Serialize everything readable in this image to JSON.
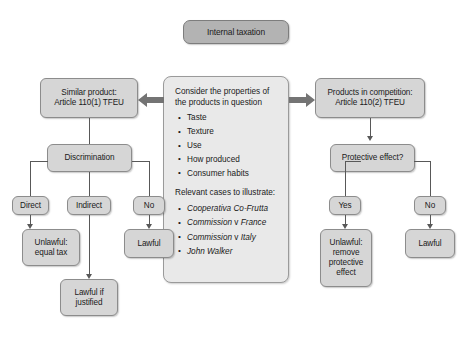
{
  "diagram": {
    "title": "Internal taxation",
    "left_branch": {
      "head": "Similar product:\nArticle 110(1) TFEU",
      "head_line1": "Similar product:",
      "head_line2": "Article 110(1) TFEU",
      "decision": "Discrimination",
      "options": [
        {
          "label": "Direct",
          "outcome_line1": "Unlawful:",
          "outcome_line2": "equal tax"
        },
        {
          "label": "Indirect",
          "outcome_line1": "Lawful if",
          "outcome_line2": "justified"
        },
        {
          "label": "No",
          "outcome_line1": "Lawful",
          "outcome_line2": ""
        }
      ]
    },
    "center_panel": {
      "lead": "Consider the properties of the products in question",
      "properties": [
        "Taste",
        "Texture",
        "Use",
        "How produced",
        "Consumer habits"
      ],
      "cases_lead": "Relevant cases to illustrate:",
      "cases": [
        {
          "italic_1": "Cooperativa Co-Frutta",
          "roman": "",
          "italic_2": ""
        },
        {
          "italic_1": "Commission",
          "roman": "v",
          "italic_2": "France"
        },
        {
          "italic_1": "Commission",
          "roman": "v",
          "italic_2": "Italy"
        },
        {
          "italic_1": "John Walker",
          "roman": "",
          "italic_2": ""
        }
      ]
    },
    "right_branch": {
      "head_line1": "Products in competition:",
      "head_line2": "Article 110(2) TFEU",
      "decision": "Protective effect?",
      "options": [
        {
          "label": "Yes",
          "outcome_line1": "Unlawful:",
          "outcome_line2": "remove",
          "outcome_line3": "protective",
          "outcome_line4": "effect"
        },
        {
          "label": "No",
          "outcome_line1": "Lawful",
          "outcome_line2": "",
          "outcome_line3": "",
          "outcome_line4": ""
        }
      ]
    },
    "arrows": {
      "left_arrow_label": "points-to-similar-product",
      "right_arrow_label": "points-to-products-in-competition"
    },
    "colors": {
      "node_fill": "#d6d6d6",
      "title_fill": "#b3b3b3",
      "panel_fill": "#e9e9e9",
      "line": "#585858",
      "arrow_fill": "#747474",
      "border": "#8c8c8c"
    }
  }
}
